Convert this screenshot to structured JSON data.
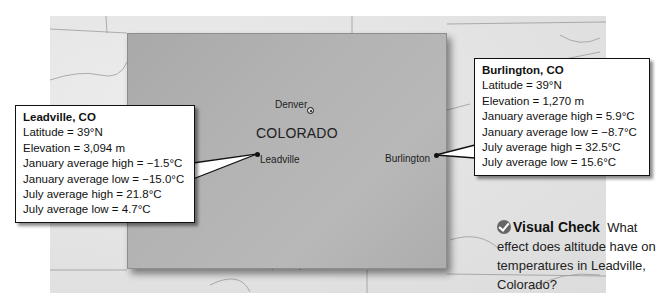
{
  "map": {
    "state_label": "COLORADO",
    "cities": [
      {
        "name": "Denver",
        "type": "capital"
      },
      {
        "name": "Leadville",
        "type": "city"
      },
      {
        "name": "Burlington",
        "type": "city"
      }
    ],
    "colors": {
      "state_fill": "#b0b0b0",
      "surrounding_fill": "#e4e4e4",
      "callout_border": "#111111"
    }
  },
  "callouts": {
    "leadville": {
      "title": "Leadville, CO",
      "rows": [
        "Latitude = 39°N",
        "Elevation = 3,094 m",
        "January average high = −1.5°C",
        "January average low = −15.0°C",
        "July average high = 21.8°C",
        "July average low = 4.7°C"
      ]
    },
    "burlington": {
      "title": "Burlington, CO",
      "rows": [
        "Latitude = 39°N",
        "Elevation = 1,270 m",
        "January average high = 5.9°C",
        "January average low = −8.7°C",
        "July average high = 32.5°C",
        "July average low = 15.6°C"
      ]
    }
  },
  "visual_check": {
    "icon": "check-icon",
    "label": "Visual Check",
    "question": "What effect does altitude have on temperatures in Leadville, Colorado?"
  }
}
